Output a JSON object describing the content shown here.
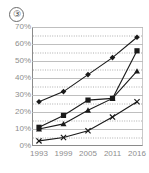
{
  "panel": {
    "label": "③"
  },
  "chart_data": {
    "type": "line",
    "title": "",
    "subtitle": "",
    "xlabel": "",
    "ylabel": "",
    "x": [
      "1993",
      "1999",
      "2005",
      "2011",
      "2016"
    ],
    "categories": [
      "1993",
      "1999",
      "2005",
      "2011",
      "2016"
    ],
    "ylim": [
      0,
      70
    ],
    "yticks": [
      "0%",
      "10%",
      "20%",
      "30%",
      "40%",
      "50%",
      "60%",
      "70%"
    ],
    "ytick_values": [
      0,
      10,
      20,
      30,
      40,
      50,
      60,
      70
    ],
    "ytick_suffix": "%",
    "grid": {
      "major": true,
      "major_step": 10,
      "minor_dotted": true,
      "minor_step": 5
    },
    "legend": {
      "visible": false,
      "position": "none"
    },
    "series": [
      {
        "name": "series-1",
        "marker": "diamond",
        "color": "#1a1a1a",
        "values": [
          26,
          32,
          42,
          52,
          64
        ]
      },
      {
        "name": "series-2",
        "marker": "square",
        "color": "#1a1a1a",
        "values": [
          11,
          18,
          27,
          28,
          56
        ]
      },
      {
        "name": "series-3",
        "marker": "triangle",
        "color": "#1a1a1a",
        "values": [
          10,
          13,
          21,
          28,
          44
        ]
      },
      {
        "name": "series-4",
        "marker": "x",
        "color": "#1a1a1a",
        "values": [
          3,
          5,
          9,
          17,
          26
        ]
      }
    ]
  },
  "colors": {
    "plot_border": "#8a8a8a",
    "grid_major": "#b8b8b8",
    "grid_minor": "#9a9a9a",
    "tick_text": "#8e8e8e",
    "series_line": "#1a1a1a",
    "background": "#ffffff"
  }
}
